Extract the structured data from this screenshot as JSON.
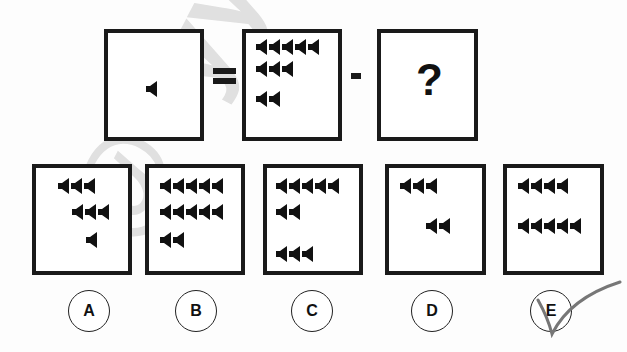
{
  "puzzle": {
    "equation": {
      "left_count": 1,
      "equals_symbol": "=",
      "minus_symbol": "-",
      "unknown_symbol": "?",
      "minuend_rows": [
        5,
        3,
        2
      ]
    },
    "options": [
      {
        "label": "A",
        "rows": [
          3,
          3,
          1
        ]
      },
      {
        "label": "B",
        "rows": [
          5,
          5,
          2
        ]
      },
      {
        "label": "C",
        "rows": [
          5,
          2,
          3
        ]
      },
      {
        "label": "D",
        "rows": [
          3,
          2
        ]
      },
      {
        "label": "E",
        "rows": [
          4,
          5
        ]
      }
    ],
    "marked_answer": "E",
    "icon": "speaker-icon",
    "watermark_text": "@cyyma"
  }
}
